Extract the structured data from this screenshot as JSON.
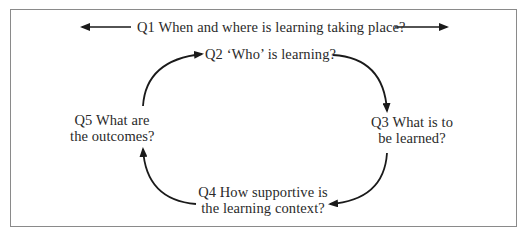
{
  "diagram": {
    "type": "learning-cycle",
    "questions": {
      "q1": {
        "label": "Q1  When and where is learning taking place?"
      },
      "q2": {
        "label": "Q2  ‘Who’ is learning?"
      },
      "q3": {
        "line1": "Q3  What is to",
        "line2": "be learned?"
      },
      "q4": {
        "line1": "Q4  How supportive is",
        "line2": "the learning context?"
      },
      "q5": {
        "line1": "Q5  What are",
        "line2": "the outcomes?"
      }
    },
    "flow": [
      "Q2",
      "Q3",
      "Q4",
      "Q5",
      "Q2"
    ],
    "q1_arrows": [
      "left",
      "right"
    ],
    "colors": {
      "border": "#8a8a8a",
      "arrow": "#1a1a1a",
      "text": "#2a2a2a"
    }
  }
}
